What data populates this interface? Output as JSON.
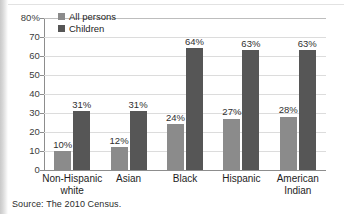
{
  "chart_data": {
    "type": "bar",
    "title": "",
    "xlabel": "",
    "ylabel": "",
    "ylim": [
      0,
      80
    ],
    "grid": true,
    "legend_position": "top-left",
    "categories": [
      "Non-Hispanic white",
      "Asian",
      "Black",
      "Hispanic",
      "American Indian"
    ],
    "category_lines": [
      [
        "Non-Hispanic",
        "white"
      ],
      [
        "Asian",
        ""
      ],
      [
        "Black",
        ""
      ],
      [
        "Hispanic",
        ""
      ],
      [
        "American",
        "Indian"
      ]
    ],
    "ytick_labels": [
      "80%",
      "70",
      "60",
      "50",
      "40",
      "30",
      "20",
      "10",
      "0"
    ],
    "ytick_values": [
      80,
      70,
      60,
      50,
      40,
      30,
      20,
      10,
      0
    ],
    "series": [
      {
        "name": "All persons",
        "color": "#8b8b8b",
        "values": [
          10,
          12,
          24,
          27,
          28
        ],
        "labels": [
          "10%",
          "12%",
          "24%",
          "27%",
          "28%"
        ]
      },
      {
        "name": "Children",
        "color": "#565656",
        "values": [
          31,
          31,
          64,
          63,
          63
        ],
        "labels": [
          "31%",
          "31%",
          "64%",
          "63%",
          "63%"
        ]
      }
    ]
  },
  "legend": {
    "items": [
      {
        "label": "All persons",
        "color": "#8b8b8b"
      },
      {
        "label": "Children",
        "color": "#565656"
      }
    ]
  },
  "source": {
    "text": "Source: The 2010 Census."
  }
}
